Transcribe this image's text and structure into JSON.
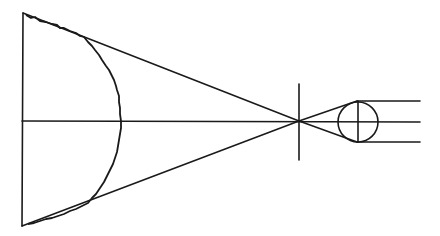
{
  "diagram": {
    "stroke_color": "#1a1a1a",
    "background": "#ffffff",
    "elements": {
      "object_plane": {
        "x1": 23,
        "y1": 13,
        "x2": 22,
        "y2": 226
      },
      "upper_ray": {
        "x1": 23,
        "y1": 13,
        "x2": 299,
        "y2": 121
      },
      "lower_ray": {
        "x1": 22,
        "y1": 226,
        "x2": 299,
        "y2": 121
      },
      "optical_axis": {
        "x1": 22,
        "y1": 121,
        "x2": 420,
        "y2": 121
      },
      "aperture_stop": {
        "x": 299,
        "y1": 84,
        "y2": 160
      },
      "lens_circle": {
        "cx": 358,
        "cy": 122,
        "r": 20
      },
      "outgoing_rays_y": [
        101,
        122,
        142
      ],
      "outgoing_rays_x_end": 420
    }
  }
}
